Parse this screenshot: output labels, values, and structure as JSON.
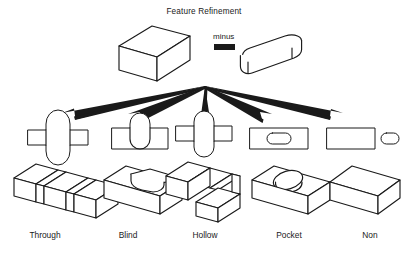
{
  "figure": {
    "title": "Feature Refinement",
    "operator_label": "minus",
    "type": "feature-taxonomy-diagram",
    "branch_count": 5
  },
  "operands": {
    "base_solid": {
      "name": "rectangular-block",
      "shape": "box"
    },
    "tool_solid": {
      "name": "rounded-slot-tool",
      "shape": "stadium-prism"
    }
  },
  "branches": [
    {
      "label": "Through",
      "profile": "stadium extends beyond both top and bottom edges of rectangle",
      "result": "slot cut completely across the block"
    },
    {
      "label": "Blind",
      "profile": "stadium protrudes past the top edge only",
      "result": "rounded slot cut partway into the block"
    },
    {
      "label": "Hollow",
      "profile": "stadium straddles the top edge of the rectangle",
      "result": "notch cut through one side of the block"
    },
    {
      "label": "Pocket",
      "profile": "stadium lies entirely inside the rectangle",
      "result": "oval depression on the top face"
    },
    {
      "label": "Non",
      "profile": "stadium lies entirely outside the rectangle",
      "result": "block unchanged"
    }
  ],
  "colors": {
    "ink": "#1a1a1a",
    "paper": "#ffffff"
  }
}
